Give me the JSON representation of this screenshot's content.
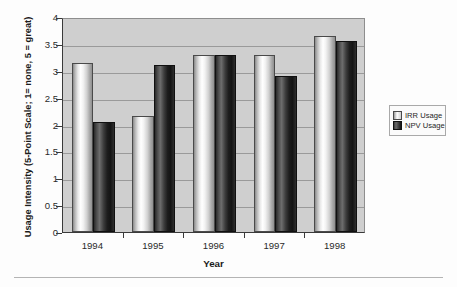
{
  "chart_data": {
    "type": "bar",
    "title": "",
    "xlabel": "Year",
    "ylabel": "Usage Intensity (5-Point Scale; 1= none, 5 = great)",
    "categories": [
      "1994",
      "1995",
      "1996",
      "1997",
      "1998"
    ],
    "series": [
      {
        "name": "IRR Usage",
        "color": "#ffffff",
        "values": [
          3.15,
          2.15,
          3.3,
          3.3,
          3.65
        ]
      },
      {
        "name": "NPV Usage",
        "color": "#1a1a1a",
        "values": [
          2.05,
          3.1,
          3.3,
          2.9,
          3.55
        ]
      }
    ],
    "ylim": [
      0,
      4
    ],
    "yticks": [
      "0",
      "0.5",
      "1",
      "1.5",
      "2",
      "2.5",
      "3",
      "3.5",
      "4"
    ],
    "ytick_values": [
      0,
      0.5,
      1,
      1.5,
      2,
      2.5,
      3,
      3.5,
      4
    ],
    "grid": true,
    "legend_position": "right",
    "plot_background": "#cfcfcf",
    "figure_background": "#fdfdfd"
  },
  "legend": {
    "items": [
      {
        "label": "IRR Usage",
        "swatch": "light-swatch-icon"
      },
      {
        "label": "NPV Usage",
        "swatch": "dark-swatch-icon"
      }
    ]
  }
}
